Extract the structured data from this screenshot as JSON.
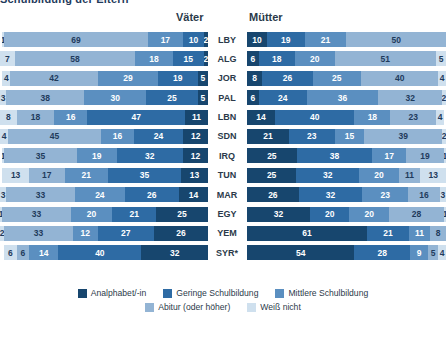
{
  "title": "Schulbildung der Eltern",
  "headers": {
    "left": "Väter",
    "right": "Mütter"
  },
  "colors": {
    "analphabet": "#17466e",
    "gering": "#2e6ba4",
    "mittel": "#5b8fc0",
    "abitur": "#93b4d4",
    "weiss_nicht": "#cfe0ee"
  },
  "legend": [
    {
      "label": "Analphabet/-in",
      "color_key": "analphabet"
    },
    {
      "label": "Geringe Schulbildung",
      "color_key": "gering"
    },
    {
      "label": "Mittlere Schulbildung",
      "color_key": "mittel"
    },
    {
      "label": "Abitur (oder höher)",
      "color_key": "abitur"
    },
    {
      "label": "Weiß nicht",
      "color_key": "weiss_nicht"
    }
  ],
  "chart_data": {
    "type": "bar",
    "subtype": "diverging-stacked-bar",
    "title": "Schulbildung der Eltern",
    "xlabel": "",
    "ylabel": "",
    "xlim": [
      0,
      100
    ],
    "grid": false,
    "legend_position": "bottom",
    "categories": [
      "LBY",
      "ALG",
      "JOR",
      "PAL",
      "LBN",
      "SDN",
      "IRQ",
      "TUN",
      "MAR",
      "EGY",
      "YEM",
      "SYR*"
    ],
    "series_names": [
      "Analphabet/-in",
      "Geringe Schulbildung",
      "Mittlere Schulbildung",
      "Abitur (oder höher)",
      "Weiß nicht"
    ],
    "panels": [
      {
        "name": "Väter",
        "order": "reversed",
        "note": "Segments drawn light-to-dark toward the centre; first number is clipped at the left image edge.",
        "rows": [
          {
            "country": "LBY",
            "values": [
              1,
              69,
              17,
              10,
              2
            ]
          },
          {
            "country": "ALG",
            "values": [
              7,
              58,
              18,
              15,
              2
            ]
          },
          {
            "country": "JOR",
            "values": [
              4,
              42,
              29,
              19,
              5
            ]
          },
          {
            "country": "PAL",
            "values": [
              3,
              38,
              30,
              25,
              5
            ]
          },
          {
            "country": "LBN",
            "values": [
              8,
              18,
              16,
              47,
              11
            ]
          },
          {
            "country": "SDN",
            "values": [
              4,
              45,
              16,
              24,
              12
            ]
          },
          {
            "country": "IRQ",
            "values": [
              1,
              35,
              19,
              32,
              12
            ]
          },
          {
            "country": "TUN",
            "values": [
              13,
              17,
              21,
              35,
              13
            ]
          },
          {
            "country": "MAR",
            "values": [
              3,
              33,
              24,
              26,
              14
            ]
          },
          {
            "country": "EGY",
            "values": [
              1,
              33,
              20,
              21,
              25
            ]
          },
          {
            "country": "YEM",
            "values": [
              2,
              33,
              12,
              27,
              26
            ]
          },
          {
            "country": "SYR*",
            "values": [
              6,
              6,
              14,
              40,
              32
            ]
          }
        ],
        "value_series_order": [
          "Weiß nicht",
          "Abitur (oder höher)",
          "Mittlere Schulbildung",
          "Geringe Schulbildung",
          "Analphabet/-in"
        ]
      },
      {
        "name": "Mütter",
        "order": "normal",
        "note": "Segments drawn dark-to-light from the centre outward.",
        "rows": [
          {
            "country": "LBY",
            "values": [
              10,
              19,
              21,
              50,
              0
            ]
          },
          {
            "country": "ALG",
            "values": [
              6,
              18,
              20,
              51,
              5
            ]
          },
          {
            "country": "JOR",
            "values": [
              8,
              26,
              25,
              40,
              4
            ]
          },
          {
            "country": "PAL",
            "values": [
              6,
              24,
              36,
              32,
              2
            ]
          },
          {
            "country": "LBN",
            "values": [
              14,
              40,
              18,
              23,
              4
            ]
          },
          {
            "country": "SDN",
            "values": [
              21,
              23,
              15,
              39,
              2
            ]
          },
          {
            "country": "IRQ",
            "values": [
              25,
              38,
              17,
              19,
              1
            ]
          },
          {
            "country": "TUN",
            "values": [
              25,
              32,
              20,
              11,
              13
            ]
          },
          {
            "country": "MAR",
            "values": [
              26,
              32,
              23,
              16,
              3
            ]
          },
          {
            "country": "EGY",
            "values": [
              32,
              20,
              20,
              28,
              1
            ]
          },
          {
            "country": "YEM",
            "values": [
              61,
              21,
              11,
              8,
              0
            ]
          },
          {
            "country": "SYR*",
            "values": [
              54,
              28,
              9,
              5,
              4
            ]
          }
        ],
        "value_series_order": [
          "Analphabet/-in",
          "Geringe Schulbildung",
          "Mittlere Schulbildung",
          "Abitur (oder höher)",
          "Weiß nicht"
        ]
      }
    ]
  }
}
